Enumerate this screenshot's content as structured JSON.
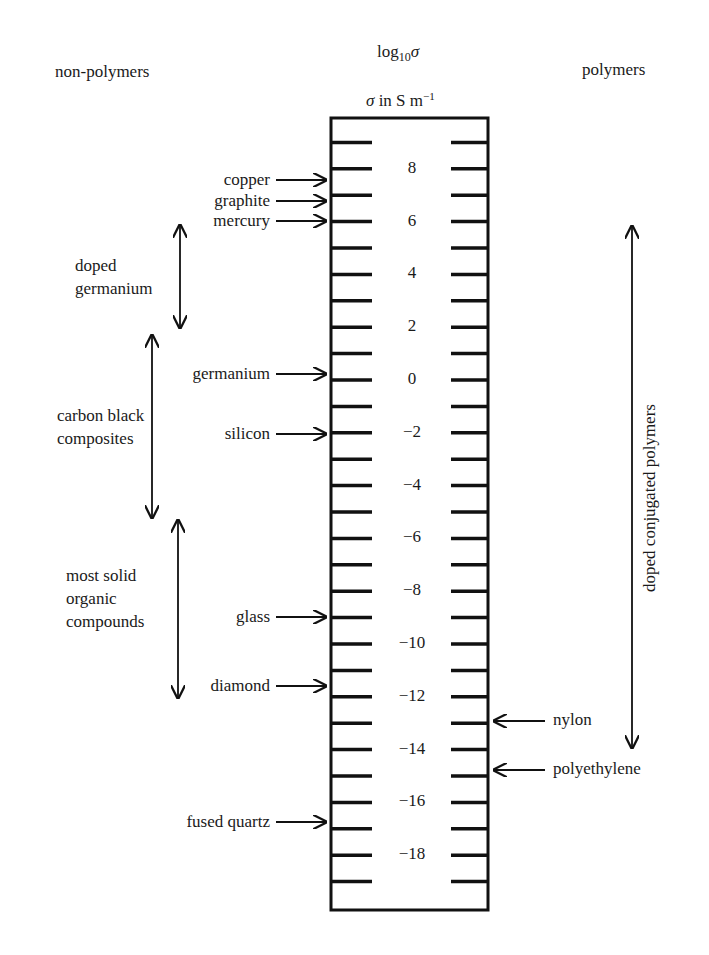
{
  "header": {
    "left": "non-polymers",
    "right": "polymers",
    "axis_title_main": "log",
    "axis_title_sub": "10",
    "axis_title_sigma": "σ",
    "unit_prefix": "σ in S m",
    "unit_exp": "−1"
  },
  "scale": {
    "tick_min": -19,
    "tick_max": 9,
    "labels": [
      "8",
      "6",
      "4",
      "2",
      "0",
      "−2",
      "−4",
      "−6",
      "−8",
      "−10",
      "−12",
      "−14",
      "−16",
      "−18"
    ],
    "label_values": [
      8,
      6,
      4,
      2,
      0,
      -2,
      -4,
      -6,
      -8,
      -10,
      -12,
      -14,
      -16,
      -18
    ]
  },
  "left_materials": [
    {
      "label": "copper",
      "value": 8
    },
    {
      "label": "graphite",
      "value": 7
    },
    {
      "label": "mercury",
      "value": 6
    },
    {
      "label": "germanium",
      "value": 0
    },
    {
      "label": "silicon",
      "value": -2
    },
    {
      "label": "glass",
      "value": -9
    },
    {
      "label": "diamond",
      "value": -11.5
    },
    {
      "label": "fused quartz",
      "value": -16.5
    }
  ],
  "left_ranges": [
    {
      "lines": [
        "doped",
        "germanium"
      ],
      "from": 6,
      "to": 2
    },
    {
      "lines": [
        "carbon black",
        "composites"
      ],
      "from": 2,
      "to": -5
    },
    {
      "lines": [
        "most solid",
        "organic",
        "compounds"
      ],
      "from": -5,
      "to": -12
    }
  ],
  "right_materials": [
    {
      "label": "nylon",
      "value": -13
    },
    {
      "label": "polyethylene",
      "value": -14.7
    }
  ],
  "right_ranges": [
    {
      "label": "doped conjugated polymers",
      "from": 6,
      "to": -14
    }
  ],
  "chart_data": {
    "type": "table",
    "axis_range": [
      -19,
      9
    ],
    "axis_labels": [
      8,
      6,
      4,
      2,
      0,
      -2,
      -4,
      -6,
      -8,
      -10,
      -12,
      -14,
      -16,
      -18
    ],
    "non_polymers": {
      "point_markers": {
        "copper": 8,
        "graphite": 7,
        "mercury": 6,
        "germanium": 0,
        "silicon": -2,
        "glass": -9,
        "diamond": -11.5,
        "fused quartz": -16.5
      },
      "ranges": {
        "doped germanium": [
          2,
          6
        ],
        "carbon black composites": [
          -5,
          2
        ],
        "most solid organic compounds": [
          -12,
          -5
        ]
      }
    },
    "polymers": {
      "point_markers": {
        "nylon": -13,
        "polyethylene": -14.7
      },
      "ranges": {
        "doped conjugated polymers": [
          -14,
          6
        ]
      }
    }
  }
}
